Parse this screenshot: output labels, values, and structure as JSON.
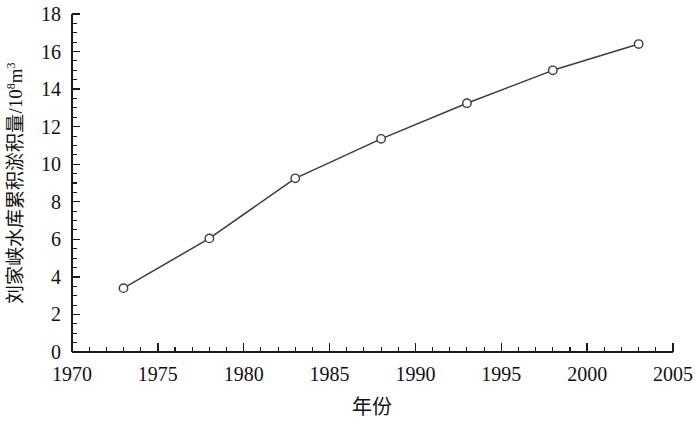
{
  "chart_data": {
    "type": "line",
    "title": "",
    "xlabel": "年份",
    "ylabel": "刘家峡水库累积淤积量/10⁸m³",
    "ylabel_parts": {
      "main": "刘家峡水库累积淤积量/10",
      "exponent": "8",
      "unit": "m",
      "unit_exponent": "3"
    },
    "x": [
      1973,
      1978,
      1983,
      1988,
      1993,
      1998,
      2003
    ],
    "values": [
      3.4,
      6.05,
      9.25,
      11.35,
      13.25,
      15.0,
      16.4
    ],
    "series": [
      {
        "name": "刘家峡水库累积淤积量",
        "values": [
          3.4,
          6.05,
          9.25,
          11.35,
          13.25,
          15.0,
          16.4
        ]
      }
    ],
    "xlim": [
      1970,
      2005
    ],
    "ylim": [
      0,
      18
    ],
    "xticks": [
      1970,
      1975,
      1980,
      1985,
      1990,
      1995,
      2000,
      2005
    ],
    "xtick_labels": [
      "1970",
      "1975",
      "1980",
      "1985",
      "1990",
      "1995",
      "2000",
      "2005"
    ],
    "yticks": [
      0,
      2,
      4,
      6,
      8,
      10,
      12,
      14,
      16,
      18
    ],
    "ytick_labels": [
      "0",
      "2",
      "4",
      "6",
      "8",
      "10",
      "12",
      "14",
      "16",
      "18"
    ],
    "x_minor_step": 1,
    "y_minor_step": 0.5,
    "grid": false,
    "legend": "none",
    "marker": "open-circle",
    "line_color": "#3b3b42",
    "marker_fill": "#ffffff",
    "axis_color": "#1a1a1a",
    "background": "#ffffff"
  }
}
